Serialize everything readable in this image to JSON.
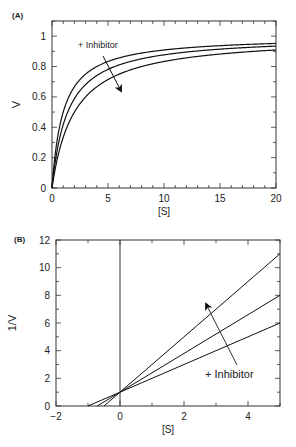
{
  "chart_data": [
    {
      "panel": "(A)",
      "type": "line",
      "title": "",
      "xlabel": "[S]",
      "ylabel": "V",
      "xlim": [
        0,
        20
      ],
      "ylim": [
        0,
        1.1
      ],
      "xticks": [
        0,
        5,
        10,
        15,
        20
      ],
      "yticks": [
        0,
        0.2,
        0.4,
        0.6,
        0.8,
        1
      ],
      "annotation": "+ Inhibitor",
      "series": [
        {
          "name": "no inhibitor",
          "Vmax": 1,
          "Km": 1
        },
        {
          "name": "inhibitor low",
          "Vmax": 1,
          "Km": 1.4
        },
        {
          "name": "inhibitor high",
          "Vmax": 1,
          "Km": 2
        }
      ]
    },
    {
      "panel": "(B)",
      "type": "line",
      "title": "",
      "xlabel": "[S]",
      "ylabel": "1/V",
      "xlim": [
        -2,
        5
      ],
      "ylim": [
        0,
        12
      ],
      "xticks": [
        -2,
        0,
        2,
        4
      ],
      "yticks": [
        0,
        2,
        4,
        6,
        8,
        10,
        12
      ],
      "annotation": "+ Inhibitor",
      "series": [
        {
          "name": "no inhibitor",
          "intercept": 1,
          "slope": 1,
          "x_intercept": -1,
          "value_at_5": 6
        },
        {
          "name": "inhibitor low",
          "intercept": 1,
          "slope": 1.4,
          "x_intercept": -0.714,
          "value_at_5": 8
        },
        {
          "name": "inhibitor high",
          "intercept": 1,
          "slope": 2,
          "x_intercept": -0.5,
          "value_at_5": 11
        }
      ]
    }
  ]
}
